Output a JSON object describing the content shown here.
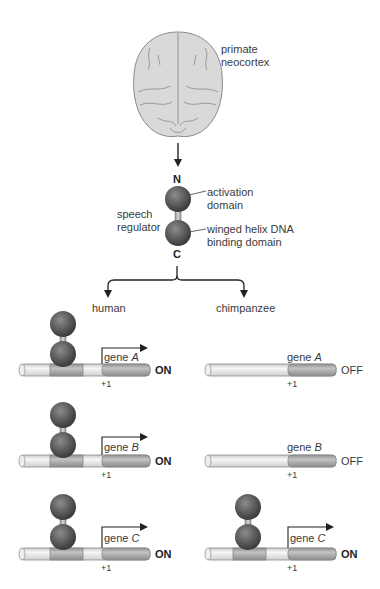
{
  "brain": {
    "label_line1": "primate",
    "label_line2": "neocortex"
  },
  "regulator": {
    "n_terminus": "N",
    "c_terminus": "C",
    "name_line1": "speech",
    "name_line2": "regulator",
    "activation_line1": "activation",
    "activation_line2": "domain",
    "binding_line1": "winged helix DNA",
    "binding_line2": "binding domain"
  },
  "species": {
    "human": "human",
    "chimp": "chimpanzee"
  },
  "genes": [
    {
      "prefix": "gene ",
      "name": "A",
      "tss": "+1",
      "human_state": "ON",
      "chimp_state": "OFF"
    },
    {
      "prefix": "gene ",
      "name": "B",
      "tss": "+1",
      "human_state": "ON",
      "chimp_state": "OFF"
    },
    {
      "prefix": "gene ",
      "name": "C",
      "tss": "+1",
      "human_state": "ON",
      "chimp_state": "ON"
    }
  ],
  "colors": {
    "sphere": "#5a5a5a",
    "dna_light": "#e8e8e8",
    "dna_dark": "#a9a9a9",
    "brain_fill": "#d9d9d9",
    "brain_line": "#8a8a8a",
    "arrow": "#222222"
  }
}
